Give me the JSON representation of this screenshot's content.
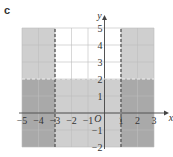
{
  "panel_label": "c",
  "chart_data": {
    "type": "inequality-region",
    "title": "",
    "xlabel": "x",
    "ylabel": "y",
    "xlim": [
      -5,
      3
    ],
    "ylim": [
      -2,
      5
    ],
    "x_ticks": [
      -5,
      -4,
      -3,
      -2,
      -1,
      1,
      2,
      3
    ],
    "y_ticks": [
      -2,
      -1,
      1,
      2,
      3,
      4,
      5
    ],
    "origin_label": "O",
    "grid": true,
    "boundary_lines": [
      {
        "equation": "x = -3",
        "style": "dashed"
      },
      {
        "equation": "x = 1",
        "style": "dashed"
      },
      {
        "equation": "y = 2",
        "style": "dashed"
      }
    ],
    "unshaded_region": "-3 < x < 1 and y > 2",
    "shading": [
      {
        "region": "x < -3, y > 2",
        "level": "light"
      },
      {
        "region": "x > 1, y > 2",
        "level": "light"
      },
      {
        "region": "-3 < x < 1, y < 2",
        "level": "light"
      },
      {
        "region": "x < -3, y < 2",
        "level": "dark"
      },
      {
        "region": "x > 1, y < 2",
        "level": "dark"
      }
    ],
    "colors": {
      "light": "#cfcfcf",
      "dark": "#a9a9a9",
      "unshaded": "#ffffff",
      "grid": "#bdbdbd",
      "axis": "#444444"
    }
  }
}
